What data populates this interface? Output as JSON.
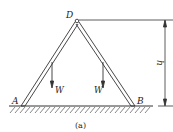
{
  "diagram": {
    "type": "A-frame ladder statics figure",
    "points": {
      "apex": {
        "label": "D"
      },
      "left_foot": {
        "label": "A"
      },
      "right_foot": {
        "label": "B"
      }
    },
    "loads": [
      {
        "label": "W",
        "position": "left rod midpoint",
        "direction": "down"
      },
      {
        "label": "W",
        "position": "right rod midpoint",
        "direction": "down"
      }
    ],
    "dimension": {
      "label": "h",
      "meaning": "height of D above ground"
    },
    "caption": "(a)",
    "colors": {
      "line": "#333333",
      "background": "#ffffff"
    }
  }
}
